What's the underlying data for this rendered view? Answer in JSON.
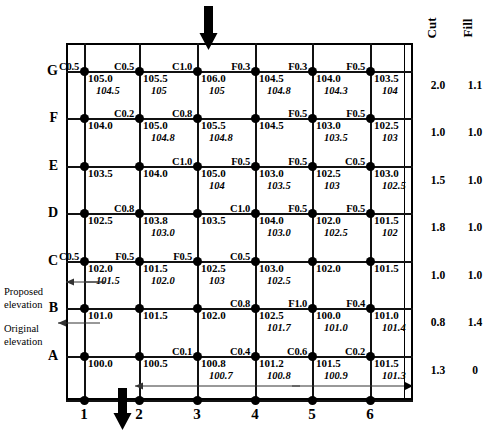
{
  "diagram": {
    "row_labels": [
      "G",
      "F",
      "E",
      "D",
      "C",
      "B",
      "A"
    ],
    "col_labels": [
      "1",
      "2",
      "3",
      "4",
      "5",
      "6"
    ],
    "headers": {
      "cut": "Cut",
      "fill": "Fill"
    },
    "annotations": {
      "proposed": "Proposed\nelevation",
      "proposed_line1": "Proposed",
      "proposed_line2": "elevation",
      "original_line1": "Original",
      "original_line2": "elevation"
    },
    "icons": {
      "down_arrow_top": "down-arrow-icon",
      "down_arrow_bottom": "down-arrow-icon",
      "left_arrow_bottom": "left-arrow-icon",
      "leader_proposed": "leader-arrow-icon",
      "leader_original": "leader-arrow-icon"
    }
  },
  "chart_data": {
    "type": "table",
    "xlabel": "",
    "ylabel": "",
    "rows": [
      "G",
      "F",
      "E",
      "D",
      "C",
      "B",
      "A"
    ],
    "columns": [
      "1",
      "2",
      "3",
      "4",
      "5",
      "6"
    ],
    "cut_fill_note": "C = cut depth, F = fill depth at each grid node",
    "cut_totals": {
      "G": "2.0",
      "F": "1.0",
      "E": "1.5",
      "D": "1.8",
      "C": "1.0",
      "B": "0.8",
      "A": "1.3"
    },
    "fill_totals": {
      "G": "1.1",
      "F": "1.0",
      "E": "1.0",
      "D": "1.0",
      "C": "1.0",
      "B": "1.4",
      "A": "0"
    },
    "nodes": [
      {
        "row": "G",
        "col": "1",
        "tag": "C0.5"
      },
      {
        "row": "G",
        "col": "2",
        "tag": "C0.5"
      },
      {
        "row": "G",
        "col": "3",
        "tag": "C1.0"
      },
      {
        "row": "G",
        "col": "4",
        "tag": "F0.3"
      },
      {
        "row": "G",
        "col": "5",
        "tag": "F0.3"
      },
      {
        "row": "G",
        "col": "6",
        "tag": "F0.5"
      },
      {
        "row": "F",
        "col": "1",
        "tag": ""
      },
      {
        "row": "F",
        "col": "2",
        "tag": "C0.2"
      },
      {
        "row": "F",
        "col": "3",
        "tag": "C0.8"
      },
      {
        "row": "F",
        "col": "4",
        "tag": ""
      },
      {
        "row": "F",
        "col": "5",
        "tag": "F0.5"
      },
      {
        "row": "F",
        "col": "6",
        "tag": "F0.5"
      },
      {
        "row": "E",
        "col": "1",
        "tag": ""
      },
      {
        "row": "E",
        "col": "2",
        "tag": ""
      },
      {
        "row": "E",
        "col": "3",
        "tag": "C1.0"
      },
      {
        "row": "E",
        "col": "4",
        "tag": "F0.5"
      },
      {
        "row": "E",
        "col": "5",
        "tag": "F0.5"
      },
      {
        "row": "E",
        "col": "6",
        "tag": "C0.5"
      },
      {
        "row": "D",
        "col": "1",
        "tag": ""
      },
      {
        "row": "D",
        "col": "2",
        "tag": "C0.8"
      },
      {
        "row": "D",
        "col": "3",
        "tag": ""
      },
      {
        "row": "D",
        "col": "4",
        "tag": "C1.0"
      },
      {
        "row": "D",
        "col": "5",
        "tag": "F0.5"
      },
      {
        "row": "D",
        "col": "6",
        "tag": "F0.5"
      },
      {
        "row": "C",
        "col": "1",
        "tag": "C0.5"
      },
      {
        "row": "C",
        "col": "2",
        "tag": "F0.5"
      },
      {
        "row": "C",
        "col": "3",
        "tag": "F0.5"
      },
      {
        "row": "C",
        "col": "4",
        "tag": "C0.5"
      },
      {
        "row": "C",
        "col": "5",
        "tag": ""
      },
      {
        "row": "C",
        "col": "6",
        "tag": ""
      },
      {
        "row": "B",
        "col": "1",
        "tag": ""
      },
      {
        "row": "B",
        "col": "2",
        "tag": ""
      },
      {
        "row": "B",
        "col": "3",
        "tag": ""
      },
      {
        "row": "B",
        "col": "4",
        "tag": "C0.8"
      },
      {
        "row": "B",
        "col": "5",
        "tag": "F1.0"
      },
      {
        "row": "B",
        "col": "6",
        "tag": "F0.4"
      },
      {
        "row": "A",
        "col": "1",
        "tag": ""
      },
      {
        "row": "A",
        "col": "2",
        "tag": ""
      },
      {
        "row": "A",
        "col": "3",
        "tag": "C0.1"
      },
      {
        "row": "A",
        "col": "4",
        "tag": "C0.4"
      },
      {
        "row": "A",
        "col": "5",
        "tag": "C0.6"
      },
      {
        "row": "A",
        "col": "6",
        "tag": "C0.2"
      }
    ],
    "cells": [
      {
        "row": "G",
        "col": "1",
        "proposed": "105.0",
        "original": "104.5"
      },
      {
        "row": "G",
        "col": "2",
        "proposed": "105.5",
        "original": "105"
      },
      {
        "row": "G",
        "col": "3",
        "proposed": "106.0",
        "original": "105"
      },
      {
        "row": "G",
        "col": "4",
        "proposed": "104.5",
        "original": "104.8"
      },
      {
        "row": "G",
        "col": "5",
        "proposed": "104.0",
        "original": "104.3"
      },
      {
        "row": "G",
        "col": "6",
        "proposed": "103.5",
        "original": "104"
      },
      {
        "row": "F",
        "col": "1",
        "proposed": "104.0",
        "original": ""
      },
      {
        "row": "F",
        "col": "2",
        "proposed": "105.0",
        "original": "104.8"
      },
      {
        "row": "F",
        "col": "3",
        "proposed": "105.5",
        "original": "104.8"
      },
      {
        "row": "F",
        "col": "4",
        "proposed": "104.5",
        "original": ""
      },
      {
        "row": "F",
        "col": "5",
        "proposed": "103.0",
        "original": "103.5"
      },
      {
        "row": "F",
        "col": "6",
        "proposed": "102.5",
        "original": "103"
      },
      {
        "row": "E",
        "col": "1",
        "proposed": "103.5",
        "original": ""
      },
      {
        "row": "E",
        "col": "2",
        "proposed": "104.0",
        "original": ""
      },
      {
        "row": "E",
        "col": "3",
        "proposed": "105.0",
        "original": "104"
      },
      {
        "row": "E",
        "col": "4",
        "proposed": "103.0",
        "original": "103.5"
      },
      {
        "row": "E",
        "col": "5",
        "proposed": "102.5",
        "original": "103"
      },
      {
        "row": "E",
        "col": "6",
        "proposed": "103.0",
        "original": "102.5"
      },
      {
        "row": "D",
        "col": "1",
        "proposed": "102.5",
        "original": ""
      },
      {
        "row": "D",
        "col": "2",
        "proposed": "103.8",
        "original": "103.0"
      },
      {
        "row": "D",
        "col": "3",
        "proposed": "103.5",
        "original": ""
      },
      {
        "row": "D",
        "col": "4",
        "proposed": "104.0",
        "original": "103.0"
      },
      {
        "row": "D",
        "col": "5",
        "proposed": "102.0",
        "original": "102.5"
      },
      {
        "row": "D",
        "col": "6",
        "proposed": "101.5",
        "original": "102"
      },
      {
        "row": "C",
        "col": "1",
        "proposed": "102.0",
        "original": "101.5"
      },
      {
        "row": "C",
        "col": "2",
        "proposed": "101.5",
        "original": "102.0"
      },
      {
        "row": "C",
        "col": "3",
        "proposed": "102.5",
        "original": "103"
      },
      {
        "row": "C",
        "col": "4",
        "proposed": "103.0",
        "original": "102.5"
      },
      {
        "row": "C",
        "col": "5",
        "proposed": "102.0",
        "original": ""
      },
      {
        "row": "C",
        "col": "6",
        "proposed": "101.5",
        "original": ""
      },
      {
        "row": "B",
        "col": "1",
        "proposed": "101.0",
        "original": ""
      },
      {
        "row": "B",
        "col": "2",
        "proposed": "101.5",
        "original": ""
      },
      {
        "row": "B",
        "col": "3",
        "proposed": "102.0",
        "original": ""
      },
      {
        "row": "B",
        "col": "4",
        "proposed": "102.5",
        "original": "101.7"
      },
      {
        "row": "B",
        "col": "5",
        "proposed": "100.0",
        "original": "101.0"
      },
      {
        "row": "B",
        "col": "6",
        "proposed": "101.0",
        "original": "101.4"
      },
      {
        "row": "A",
        "col": "1",
        "proposed": "100.0",
        "original": ""
      },
      {
        "row": "A",
        "col": "2",
        "proposed": "100.5",
        "original": ""
      },
      {
        "row": "A",
        "col": "3",
        "proposed": "100.8",
        "original": "100.7"
      },
      {
        "row": "A",
        "col": "4",
        "proposed": "101.2",
        "original": "100.8"
      },
      {
        "row": "A",
        "col": "5",
        "proposed": "101.5",
        "original": "100.9"
      },
      {
        "row": "A",
        "col": "6",
        "proposed": "101.5",
        "original": "101.3"
      }
    ]
  }
}
